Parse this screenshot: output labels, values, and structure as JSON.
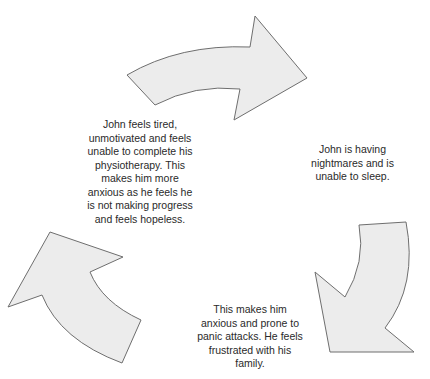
{
  "diagram": {
    "type": "cycle",
    "direction": "clockwise",
    "steps": [
      {
        "text": "John feels tired,\nunmotivated and feels\nunable to complete his\nphysiotherapy. This\nmakes him more\nanxious as he feels he\nis not making progress\nand feels hopeless."
      },
      {
        "text": "John is having\nnightmares and is\nunable to sleep."
      },
      {
        "text": "This makes him\nanxious and prone to\npanic attacks. He feels\nfrustrated with his\nfamily."
      }
    ],
    "colors": {
      "arrow_fill": "#ececec",
      "arrow_stroke": "#6e6e6e",
      "text": "#2a2a2a"
    }
  }
}
